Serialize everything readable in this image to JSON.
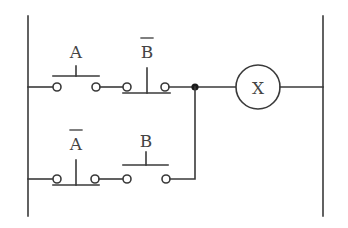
{
  "diagram": {
    "type": "ladder-logic",
    "colors": {
      "line": "#3a3a3a",
      "text": "#444444",
      "background": "#ffffff"
    },
    "rails": {
      "left": {
        "x": 28,
        "y1": 16,
        "y2": 216
      },
      "right": {
        "x": 323,
        "y1": 16,
        "y2": 216
      }
    },
    "rungs": [
      {
        "y": 87,
        "contacts": [
          {
            "label": "A",
            "type": "normally-open",
            "negated": false
          },
          {
            "label": "B",
            "type": "normally-closed",
            "negated": true
          }
        ]
      },
      {
        "y": 179,
        "contacts": [
          {
            "label": "A",
            "type": "normally-closed",
            "negated": true
          },
          {
            "label": "B",
            "type": "normally-open",
            "negated": false
          }
        ]
      }
    ],
    "junction": {
      "label": "junction-node"
    },
    "coil": {
      "label": "X"
    }
  }
}
